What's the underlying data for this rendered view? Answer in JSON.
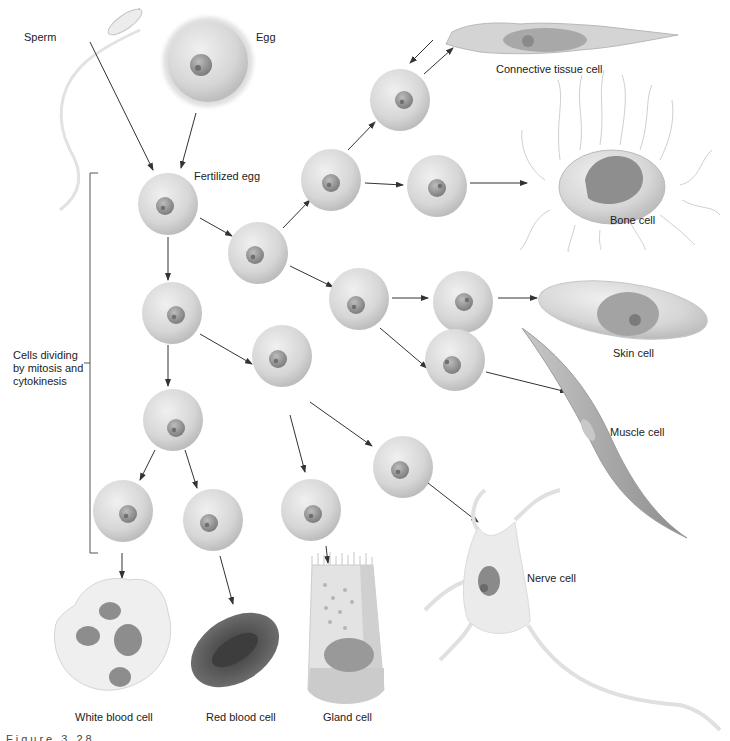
{
  "figure": {
    "caption_partial": "Figure 3.28"
  },
  "labels": {
    "sperm": "Sperm",
    "egg": "Egg",
    "fertilized_egg": "Fertilized egg",
    "dividing": "Cells dividing by mitosis and cytokinesis",
    "connective": "Connective tissue cell",
    "bone": "Bone cell",
    "skin": "Skin cell",
    "muscle": "Muscle cell",
    "nerve": "Nerve cell",
    "white_blood": "White blood cell",
    "red_blood": "Red blood cell",
    "gland": "Gland cell"
  },
  "colors": {
    "cell_fill": "#d9d9d9",
    "cell_edge": "#bdbdbd",
    "nucleus": "#9a9a9a",
    "nucleolus": "#6f6f6f",
    "arrow": "#333333",
    "rbc": "#555555",
    "background": "#ffffff"
  },
  "nodes": [
    {
      "id": "fertilized",
      "x": 168,
      "y": 204
    },
    {
      "id": "c2a",
      "x": 258,
      "y": 250
    },
    {
      "id": "c2b",
      "x": 172,
      "y": 312
    },
    {
      "id": "c3a",
      "x": 330,
      "y": 182
    },
    {
      "id": "c3b",
      "x": 358,
      "y": 298
    },
    {
      "id": "c3c",
      "x": 173,
      "y": 418
    },
    {
      "id": "c3d",
      "x": 282,
      "y": 357
    },
    {
      "id": "c4a",
      "x": 400,
      "y": 102
    },
    {
      "id": "c4b",
      "x": 434,
      "y": 187
    },
    {
      "id": "c4c",
      "x": 462,
      "y": 300
    },
    {
      "id": "c4d",
      "x": 455,
      "y": 358
    },
    {
      "id": "c4e",
      "x": 123,
      "y": 508
    },
    {
      "id": "c4f",
      "x": 213,
      "y": 518
    },
    {
      "id": "c4g",
      "x": 310,
      "y": 508
    },
    {
      "id": "c4h",
      "x": 398,
      "y": 465
    }
  ]
}
